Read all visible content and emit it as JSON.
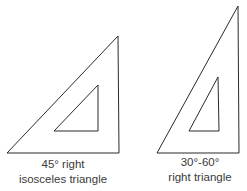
{
  "diagram": {
    "stroke_color": "#2a2a2a",
    "background": "#ffffff",
    "triangles": [
      {
        "id": "isosceles",
        "outer_points": "118,36 7,153 119,153",
        "inner_points": "98,85 54,131 98,131",
        "label_line1": "45° right",
        "label_line2": "isosceles triangle"
      },
      {
        "id": "thirty-sixty",
        "outer_points": "238,6 157,153 239,153",
        "inner_points": "218,77 189,131 219,131",
        "label_line1": "30°-60°",
        "label_line2": "right triangle"
      }
    ]
  }
}
